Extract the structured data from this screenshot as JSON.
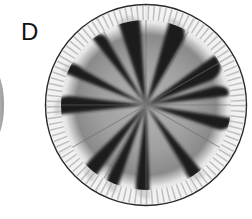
{
  "figure": {
    "panel_label": "D",
    "colors": {
      "background": "#ffffff",
      "rim": "#f4f4f4",
      "core": "#a3a3a3",
      "dark_sectors": "#1c1c1c",
      "outline": "#2a2a2a"
    },
    "circle": {
      "cx": 146,
      "cy": 105,
      "r": 101
    }
  }
}
